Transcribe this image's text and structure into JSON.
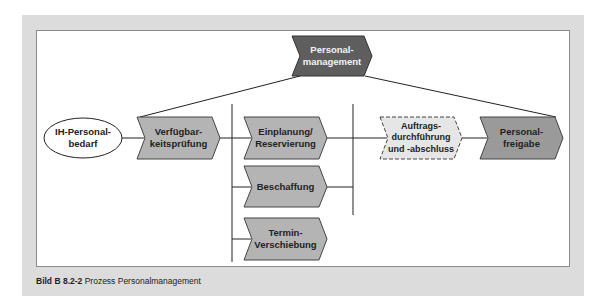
{
  "diagram": {
    "top_node": {
      "label": "Personal-\nmanagement",
      "fill": "#5e5e5e"
    },
    "start_event": {
      "label": "IH-Personal-\nbedarf"
    },
    "nodes": [
      {
        "id": "verfuegbarkeit",
        "label": "Verfügbar-\nkeitsprüfung",
        "fill": "#b4b4b4"
      },
      {
        "id": "einplanung",
        "label": "Einplanung/\nReservierung",
        "fill": "#b4b4b4"
      },
      {
        "id": "beschaffung",
        "label": "Beschaffung",
        "fill": "#b4b4b4"
      },
      {
        "id": "termin",
        "label": "Termin-\nVerschiebung",
        "fill": "#b4b4b4"
      },
      {
        "id": "auftrag",
        "label": "Auftrags-\ndurchführung\nund -abschluss",
        "fill": "#e6e6e6",
        "style": "dashed"
      },
      {
        "id": "freigabe",
        "label": "Personal-\nfreigabe",
        "fill": "#9a9a9a"
      }
    ]
  },
  "caption": {
    "figure": "Bild B 8.2-2",
    "text": " Prozess Personalmanagement"
  }
}
